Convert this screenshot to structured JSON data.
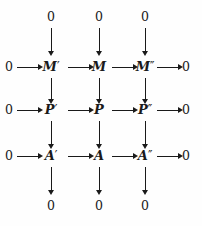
{
  "diagram": {
    "type": "commutative-diagram",
    "title": "",
    "background_color": "#fefefe",
    "ink_color": "#1a1a1a",
    "grid": {
      "columns": 3,
      "rows": 3,
      "column_x": [
        51,
        99,
        145
      ],
      "row_y": [
        67,
        110,
        156
      ],
      "left_edge_x": 9,
      "right_edge_x": 186,
      "top_edge_y": 17,
      "bottom_edge_y": 206
    },
    "zero_label": "0",
    "top_zeros": [
      {
        "label": "0",
        "column": 1
      },
      {
        "label": "0",
        "column": 2
      },
      {
        "label": "0",
        "column": 3
      }
    ],
    "bottom_zeros": [
      {
        "label": "0",
        "column": 1
      },
      {
        "label": "0",
        "column": 2
      },
      {
        "label": "0",
        "column": 3
      }
    ],
    "rows": [
      {
        "name": "row-m",
        "left_zero": "0",
        "right_zero": "0",
        "nodes": [
          {
            "base": "M",
            "prime": "′",
            "full": "M′"
          },
          {
            "base": "M",
            "prime": "",
            "full": "M"
          },
          {
            "base": "M",
            "prime": "″",
            "full": "M″"
          }
        ]
      },
      {
        "name": "row-p",
        "left_zero": "0",
        "right_zero": "0",
        "nodes": [
          {
            "base": "P",
            "prime": "′",
            "full": "P′"
          },
          {
            "base": "P",
            "prime": "",
            "full": "P"
          },
          {
            "base": "P",
            "prime": "″",
            "full": "P″"
          }
        ]
      },
      {
        "name": "row-a",
        "left_zero": "0",
        "right_zero": "0",
        "nodes": [
          {
            "base": "A",
            "prime": "′",
            "full": "A′"
          },
          {
            "base": "A",
            "prime": "",
            "full": "A"
          },
          {
            "base": "A",
            "prime": "″",
            "full": "A″"
          }
        ]
      }
    ],
    "arrows": {
      "horizontal_count": 12,
      "vertical_count": 12,
      "style": "plain-right-arrow",
      "labels": []
    }
  }
}
